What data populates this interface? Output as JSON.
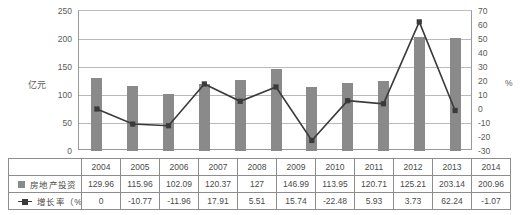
{
  "axes": {
    "left_title": "亿元",
    "right_title": "%",
    "left_ticks": [
      "250",
      "200",
      "150",
      "100",
      "50",
      "0"
    ],
    "right_ticks": [
      "70",
      "60",
      "50",
      "40",
      "30",
      "20",
      "10",
      "0",
      "-10",
      "-20",
      "-30"
    ]
  },
  "legend": {
    "bar_label": "房地产投资",
    "line_label": "增长率（%）",
    "bar_marker": "filled-square-marker",
    "line_marker": "line-square-marker"
  },
  "colors": {
    "bar": "#8a8a8a",
    "line": "#3a3a3a",
    "grid": "#b9b9b9",
    "axis": "#9a9a9a",
    "table_border": "#8d8d8d",
    "text": "#4a4a4a"
  },
  "table": {
    "years": [
      "2004",
      "2005",
      "2006",
      "2007",
      "2008",
      "2009",
      "2010",
      "2011",
      "2012",
      "2013",
      "2014"
    ],
    "investment": [
      "129.96",
      "115.96",
      "102.09",
      "120.37",
      "127",
      "146.99",
      "113.95",
      "120.71",
      "125.21",
      "203.14",
      "200.96"
    ],
    "growth": [
      "0",
      "-10.77",
      "-11.96",
      "17.91",
      "5.51",
      "15.74",
      "-22.48",
      "5.93",
      "3.73",
      "62.24",
      "-1.07"
    ]
  },
  "chart_data": {
    "type": "bar",
    "title": "",
    "subtitle": "",
    "xlabel": "",
    "ylabel": "亿元",
    "y2label": "%",
    "categories": [
      "2004",
      "2005",
      "2006",
      "2007",
      "2008",
      "2009",
      "2010",
      "2011",
      "2012",
      "2013",
      "2014"
    ],
    "series": [
      {
        "name": "房地产投资",
        "type": "bar",
        "axis": "left",
        "unit": "亿元",
        "color": "#8a8a8a",
        "values": [
          129.96,
          115.96,
          102.09,
          120.37,
          127,
          146.99,
          113.95,
          120.71,
          125.21,
          203.14,
          200.96
        ]
      },
      {
        "name": "增长率（%）",
        "type": "line",
        "axis": "right",
        "unit": "%",
        "color": "#3a3a3a",
        "marker": "square",
        "values": [
          0,
          -10.77,
          -11.96,
          17.91,
          5.51,
          15.74,
          -22.48,
          5.93,
          3.73,
          62.24,
          -1.07
        ]
      }
    ],
    "ylim": [
      0,
      250
    ],
    "ytick_step": 50,
    "y2lim": [
      -30,
      70
    ],
    "y2tick_step": 10,
    "grid": true,
    "legend_position": "table-row-labels"
  }
}
